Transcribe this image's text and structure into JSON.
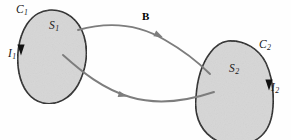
{
  "figure": {
    "name": "mutual-inductance-two-loops-diagram",
    "width": 291,
    "height": 140,
    "background_color": "#fefefe"
  },
  "style": {
    "surface_fill": "#d6d6d6",
    "surface_stroke": "#1a1a1a",
    "field_line_color": "#7d7d7d",
    "label_color": "#1a1a1a",
    "surface_stroke_width": 1.6,
    "field_line_width": 1.9
  },
  "labels": {
    "c1": {
      "base": "C",
      "sub": "1"
    },
    "s1": {
      "base": "S",
      "sub": "1"
    },
    "i1": {
      "base": "I",
      "sub": "1"
    },
    "b": {
      "text": "B"
    },
    "c2": {
      "base": "C",
      "sub": "2"
    },
    "s2": {
      "base": "S",
      "sub": "2"
    },
    "i2": {
      "base": "I",
      "sub": "2"
    }
  },
  "shapes": {
    "loop1": {
      "name": "surface-s1",
      "path": "M 50,10 C 66,9 79,20 84,36 C 89,52 86,70 78,85 C 70,99 56,106 43,103 C 30,100 22,88 19,73 C 16,57 18,38 27,24 C 34,14 41,11 50,10 Z"
    },
    "loop2": {
      "name": "surface-s2",
      "path": "M 228,41 C 245,40 259,49 266,63 C 272,76 274,92 273,107 C 272,122 266,135 254,141 C 240,148 223,146 211,137 C 199,128 194,113 196,97 C 197,81 201,65 210,53 C 215,46 221,42 228,41 Z"
    }
  },
  "field_lines": [
    {
      "name": "upper-field-line",
      "path": "M 78,30 C 110,21 140,25 165,40 C 186,52 199,63 210,74",
      "arrow_at": [
        158,
        35
      ],
      "arrow_angle": 26
    },
    {
      "name": "lower-field-line",
      "path": "M 63,55 C 82,72 103,89 130,97 C 160,106 190,100 214,92",
      "arrow_at": [
        122,
        95
      ],
      "arrow_angle": 16
    }
  ],
  "current_arrows": [
    {
      "name": "current-arrow-i1",
      "at": [
        21,
        49
      ],
      "direction": "down"
    },
    {
      "name": "current-arrow-i2",
      "at": [
        269,
        84
      ],
      "direction": "down"
    }
  ]
}
